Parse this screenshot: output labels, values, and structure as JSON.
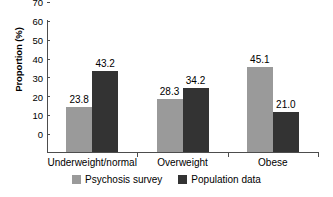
{
  "chart_data": {
    "type": "bar",
    "title": "",
    "xlabel": "",
    "ylabel": "Proportion (%)",
    "categories": [
      "Underweight/normal",
      "Overweight",
      "Obese"
    ],
    "series": [
      {
        "name": "Psychosis survey",
        "color": "#9a9a9a",
        "values": [
          23.8,
          28.3,
          45.1
        ]
      },
      {
        "name": "Population data",
        "color": "#333333",
        "values": [
          43.2,
          34.2,
          21.0
        ]
      }
    ],
    "data_labels": [
      "23.8",
      "43.2",
      "28.3",
      "34.2",
      "45.1",
      "21.0"
    ],
    "ylim": [
      0,
      70
    ],
    "ytick_step": 10,
    "ytick_labels": [
      "0",
      "10",
      "20",
      "30",
      "40",
      "50",
      "60",
      "70"
    ],
    "grid": false,
    "legend_position": "bottom"
  },
  "axes": {
    "y_title": "Proportion (%)"
  },
  "legend": {
    "entries": [
      {
        "label": "Psychosis survey",
        "swatch": "light-gray-swatch"
      },
      {
        "label": "Population data",
        "swatch": "dark-gray-swatch"
      }
    ]
  }
}
